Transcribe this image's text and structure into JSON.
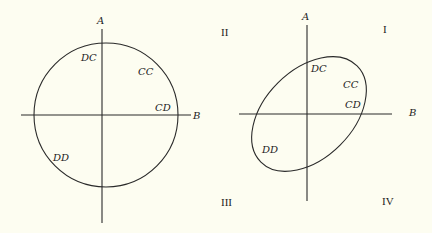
{
  "left_diagram": {
    "axes": {
      "vertical_label": "A",
      "horizontal_label": "B"
    },
    "curve": "circle",
    "points": [
      {
        "label": "DC"
      },
      {
        "label": "CC"
      },
      {
        "label": "CD"
      },
      {
        "label": "DD"
      }
    ]
  },
  "right_diagram": {
    "axes": {
      "vertical_label": "A",
      "horizontal_label": "B"
    },
    "curve": "tilted ellipse",
    "points": [
      {
        "label": "DC"
      },
      {
        "label": "CC"
      },
      {
        "label": "CD"
      },
      {
        "label": "DD"
      }
    ],
    "quadrants": [
      {
        "label": "I"
      },
      {
        "label": "II"
      },
      {
        "label": "III"
      },
      {
        "label": "IV"
      }
    ]
  },
  "colors": {
    "background": "#fdfdf1",
    "ink": "#2a2a2a"
  }
}
